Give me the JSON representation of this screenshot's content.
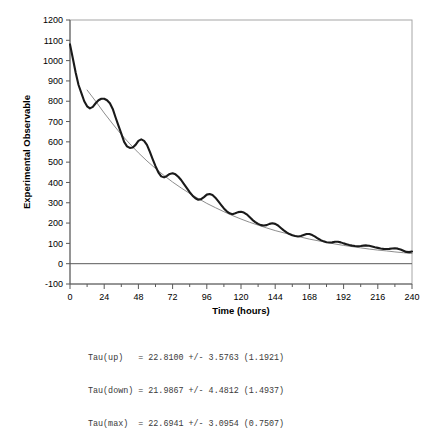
{
  "chart_data": {
    "type": "line",
    "title": "",
    "xlabel": "Time (hours)",
    "ylabel": "Experimental Observable",
    "xlim": [
      0,
      240
    ],
    "ylim": [
      -100,
      1200
    ],
    "xticks": [
      0,
      24,
      48,
      72,
      96,
      120,
      144,
      168,
      192,
      216,
      240
    ],
    "xtick_labels": [
      "0",
      "24",
      "48",
      "72",
      "96",
      "120",
      "144",
      "168",
      "192",
      "216",
      "240"
    ],
    "x_minor_tick_interval": 12,
    "yticks": [
      -100,
      0,
      100,
      200,
      300,
      400,
      500,
      600,
      700,
      800,
      900,
      1000,
      1100,
      1200
    ],
    "ytick_labels": [
      "-100",
      "0",
      "100",
      "200",
      "300",
      "400",
      "500",
      "600",
      "700",
      "800",
      "900",
      "1000",
      "1100",
      "1200"
    ],
    "grid": false,
    "legend": "none",
    "zero_line": 0,
    "series": [
      {
        "name": "Experimental data",
        "style": "thick-black-line",
        "color": "#1a1a1a",
        "x": [
          0,
          2,
          4,
          6,
          8,
          10,
          12,
          14,
          16,
          18,
          20,
          22,
          24,
          26,
          28,
          30,
          32,
          34,
          36,
          38,
          40,
          42,
          44,
          46,
          48,
          50,
          52,
          54,
          56,
          58,
          60,
          62,
          64,
          66,
          68,
          70,
          72,
          74,
          76,
          78,
          80,
          82,
          84,
          86,
          88,
          90,
          92,
          94,
          96,
          98,
          100,
          102,
          104,
          106,
          108,
          110,
          112,
          114,
          116,
          118,
          120,
          122,
          124,
          126,
          128,
          130,
          132,
          134,
          136,
          138,
          140,
          142,
          144,
          146,
          148,
          150,
          152,
          154,
          156,
          158,
          160,
          162,
          164,
          166,
          168,
          170,
          172,
          174,
          176,
          178,
          180,
          182,
          184,
          186,
          188,
          190,
          192,
          194,
          196,
          198,
          200,
          202,
          204,
          206,
          208,
          210,
          212,
          214,
          216,
          218,
          220,
          222,
          224,
          226,
          228,
          230,
          232,
          234,
          236,
          238,
          240
        ],
        "y": [
          1080,
          1010,
          940,
          880,
          840,
          800,
          775,
          765,
          772,
          790,
          805,
          812,
          812,
          805,
          790,
          762,
          720,
          680,
          640,
          600,
          578,
          570,
          572,
          585,
          605,
          612,
          605,
          585,
          552,
          515,
          480,
          450,
          430,
          425,
          432,
          442,
          445,
          440,
          428,
          412,
          392,
          372,
          352,
          335,
          322,
          315,
          318,
          328,
          340,
          343,
          338,
          325,
          308,
          290,
          272,
          258,
          248,
          244,
          248,
          254,
          256,
          252,
          243,
          230,
          216,
          205,
          196,
          190,
          188,
          190,
          196,
          199,
          196,
          188,
          176,
          164,
          154,
          146,
          140,
          136,
          134,
          136,
          141,
          146,
          146,
          141,
          133,
          124,
          116,
          110,
          106,
          104,
          105,
          108,
          108,
          105,
          100,
          96,
          92,
          89,
          87,
          86,
          87,
          89,
          90,
          88,
          85,
          81,
          78,
          75,
          73,
          72,
          73,
          75,
          76,
          74,
          70,
          64,
          58,
          57,
          60
        ]
      },
      {
        "name": "Fitted decay",
        "style": "thin-gray-line",
        "color": "#808080",
        "x": [
          12,
          18,
          24,
          30,
          36,
          42,
          48,
          54,
          60,
          66,
          72,
          78,
          84,
          90,
          96,
          102,
          108,
          114,
          120,
          126,
          132,
          138,
          144,
          150,
          156,
          162,
          168,
          174,
          180,
          186,
          192,
          198,
          204,
          210,
          216,
          222,
          228,
          234,
          240
        ],
        "y": [
          855,
          800,
          742,
          688,
          636,
          590,
          546,
          506,
          469,
          434,
          402,
          373,
          346,
          321,
          297,
          276,
          256,
          237,
          220,
          204,
          190,
          176,
          163,
          152,
          141,
          131,
          121,
          113,
          105,
          97,
          90,
          84,
          78,
          72,
          67,
          63,
          58,
          54,
          50
        ]
      }
    ]
  },
  "caption": {
    "lines": [
      "Tau(up)   = 22.8100 +/- 3.5763 (1.1921)",
      "Tau(down) = 21.9867 +/- 4.4812 (1.4937)",
      "Tau(max)  = 22.6941 +/- 3.0954 (0.7507)"
    ]
  },
  "colors": {
    "data_line": "#1a1a1a",
    "fit_line": "#808080",
    "frame": "#a6a6a6",
    "axis": "#595959",
    "text": "#000000",
    "caption_text": "#3a3a3a"
  }
}
